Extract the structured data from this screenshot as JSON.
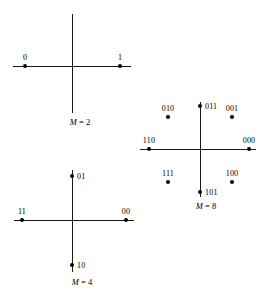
{
  "figure": {
    "background_color": "#ffffff",
    "ink_color": "#000000",
    "width": 260,
    "height": 300
  },
  "constellations": [
    {
      "id": "m2",
      "caption_symbol": "M",
      "caption_text": " = 2",
      "caption_full": "M = 2",
      "order": 2,
      "center": {
        "x": 72,
        "y": 66
      },
      "axis_h": {
        "x1": 13,
        "x2": 131
      },
      "axis_v": {
        "y1": 14,
        "y2": 113
      },
      "caption_pos": {
        "x": 80,
        "y": 117
      },
      "points": [
        {
          "label": "0",
          "x": 25,
          "y": 66,
          "label_pos": "above",
          "label_x": 25,
          "label_y": 62,
          "angle_deg": 180
        },
        {
          "label": "1",
          "x": 120,
          "y": 66,
          "label_pos": "above",
          "label_x": 120,
          "label_y": 62,
          "angle_deg": 0
        }
      ]
    },
    {
      "id": "m4",
      "caption_symbol": "M",
      "caption_text": " = 4",
      "caption_full": "M = 4",
      "order": 4,
      "center": {
        "x": 72,
        "y": 220
      },
      "axis_h": {
        "x1": 14,
        "x2": 134
      },
      "axis_v": {
        "y1": 170,
        "y2": 272
      },
      "caption_pos": {
        "x": 82,
        "y": 277
      },
      "points": [
        {
          "label": "01",
          "x": 72,
          "y": 176,
          "label_pos": "right",
          "label_x": 77,
          "label_y": 176,
          "angle_deg": 90
        },
        {
          "label": "00",
          "x": 126,
          "y": 220,
          "label_pos": "above",
          "label_x": 126,
          "label_y": 216,
          "angle_deg": 0
        },
        {
          "label": "10",
          "x": 72,
          "y": 265,
          "label_pos": "right",
          "label_x": 77,
          "label_y": 265,
          "angle_deg": 270
        },
        {
          "label": "11",
          "x": 22,
          "y": 220,
          "label_pos": "above",
          "label_x": 22,
          "label_y": 216,
          "angle_deg": 180
        }
      ]
    },
    {
      "id": "m8",
      "caption_symbol": "M",
      "caption_text": " = 8",
      "caption_full": "M = 8",
      "order": 8,
      "center": {
        "x": 200,
        "y": 149
      },
      "axis_h": {
        "x1": 140,
        "x2": 256
      },
      "axis_v": {
        "y1": 102,
        "y2": 197
      },
      "caption_pos": {
        "x": 206,
        "y": 201
      },
      "points": [
        {
          "label": "000",
          "x": 249,
          "y": 149,
          "label_pos": "above",
          "label_x": 249,
          "label_y": 145,
          "angle_deg": 0
        },
        {
          "label": "001",
          "x": 232,
          "y": 117,
          "label_pos": "above",
          "label_x": 232,
          "label_y": 113,
          "angle_deg": 45
        },
        {
          "label": "011",
          "x": 200,
          "y": 106,
          "label_pos": "right",
          "label_x": 205,
          "label_y": 106,
          "angle_deg": 90
        },
        {
          "label": "010",
          "x": 168,
          "y": 117,
          "label_pos": "above",
          "label_x": 168,
          "label_y": 113,
          "angle_deg": 135
        },
        {
          "label": "110",
          "x": 149,
          "y": 149,
          "label_pos": "above",
          "label_x": 149,
          "label_y": 145,
          "angle_deg": 180
        },
        {
          "label": "111",
          "x": 168,
          "y": 182,
          "label_pos": "above",
          "label_x": 168,
          "label_y": 178,
          "angle_deg": 225
        },
        {
          "label": "101",
          "x": 200,
          "y": 192,
          "label_pos": "right",
          "label_x": 205,
          "label_y": 192,
          "angle_deg": 270
        },
        {
          "label": "100",
          "x": 232,
          "y": 182,
          "label_pos": "above",
          "label_x": 232,
          "label_y": 178,
          "angle_deg": 315
        }
      ]
    }
  ]
}
